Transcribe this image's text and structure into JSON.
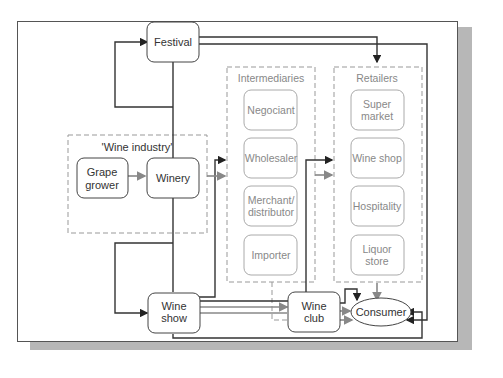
{
  "diagram": {
    "nodes": {
      "festival": "Festival",
      "grape_grower": [
        "Grape",
        "grower"
      ],
      "winery": "Winery",
      "wine_show": [
        "Wine",
        "show"
      ],
      "wine_club": [
        "Wine",
        "club"
      ],
      "consumer": "Consumer"
    },
    "groups": {
      "wine_industry": {
        "title": "'Wine industry'"
      },
      "intermediaries": {
        "title": "Intermediaries",
        "items": [
          "Negociant",
          "Wholesaler",
          [
            "Merchant/",
            "distributor"
          ],
          "Importer"
        ]
      },
      "retailers": {
        "title": "Retailers",
        "items": [
          [
            "Super",
            "market"
          ],
          "Wine shop",
          "Hospitality",
          [
            "Liquor",
            "store"
          ]
        ]
      }
    },
    "colors": {
      "dark_line": "#333333",
      "grey_line": "#8a8a8a",
      "dashed": "#999999",
      "shadow": "#b7b7b7"
    }
  }
}
